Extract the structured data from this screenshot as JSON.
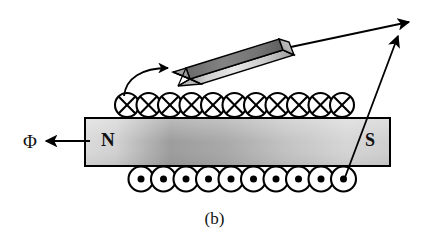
{
  "figure": {
    "caption": "(b)",
    "background_color": "#ffffff",
    "ink_color": "#000000"
  },
  "magnet": {
    "name": "permanent-magnet-bar",
    "north_pole_label": "N",
    "south_pole_label": "S",
    "fill_light": "#d8d8d8",
    "fill_dark": "#9a9a9a",
    "stroke": "#000000",
    "x": 85,
    "y": 118,
    "width": 305,
    "height": 48
  },
  "flux": {
    "symbol": "Φ",
    "arrow_direction": "left",
    "arrow_from_x": 90,
    "arrow_to_x": 45,
    "arrow_y": 141
  },
  "coils": {
    "top_row": {
      "name": "coil-cross-row",
      "marker": "cross",
      "count": 11,
      "center_y": 105,
      "radius": 12,
      "start_x": 127,
      "spacing": 21.5
    },
    "bottom_row": {
      "name": "coil-dot-row",
      "marker": "dot",
      "count": 10,
      "center_y": 179,
      "radius": 12.5,
      "start_x": 141,
      "spacing": 22.5
    }
  },
  "rod": {
    "name": "iron-rod",
    "top_face_color": "#6e6e6e",
    "side_face_light": "#e2e2e2",
    "side_face_dark": "#8d8d8d",
    "stroke": "#000000"
  },
  "arrows": {
    "insertion_arrow": {
      "name": "curved-insertion-arrow",
      "label": "",
      "style": "curved"
    },
    "rod_leader_arrow": {
      "name": "rod-leader-arrow",
      "label": "",
      "style": "straight"
    },
    "coil_leader_arrow": {
      "name": "coil-leader-arrow",
      "label": "",
      "style": "straight"
    }
  }
}
